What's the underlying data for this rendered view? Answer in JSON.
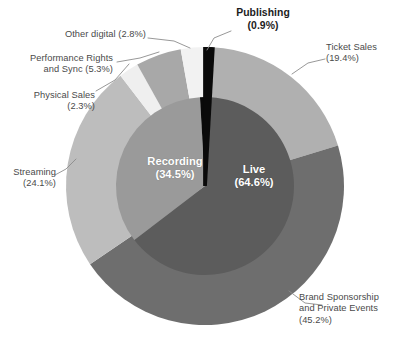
{
  "chart_data": {
    "type": "pie",
    "title": "",
    "subtitle": "",
    "xlabel": "",
    "ylabel": "",
    "legend_position": "none",
    "grid": false,
    "note": "Two-level donut: inner ring = top-level categories, outer ring = sub-categories",
    "rings": [
      {
        "name": "inner",
        "categories": [
          "Live",
          "Recording",
          "Publishing"
        ],
        "values": [
          64.6,
          34.5,
          0.9
        ],
        "colors": [
          "#5c5c5c",
          "#9a9a9a",
          "#0a0a0a"
        ],
        "labels_inside": [
          "Live\n(64.6%)",
          "Recording\n(34.5%)",
          ""
        ]
      },
      {
        "name": "outer",
        "categories": [
          "Publishing",
          "Ticket Sales",
          "Brand Sponsorship and Private Events",
          "Streaming",
          "Physical Sales",
          "Performance Rights and Sync",
          "Other digital"
        ],
        "values": [
          0.9,
          19.4,
          45.2,
          24.1,
          2.3,
          5.3,
          2.8
        ],
        "colors": [
          "#0a0a0a",
          "#b0b0b0",
          "#6e6e6e",
          "#bdbdbd",
          "#efefef",
          "#a8a8a8",
          "#f2f2f2"
        ]
      }
    ],
    "slices": [
      {
        "label": "Publishing",
        "value": 0.9,
        "display": "(0.9%)",
        "color": "#0a0a0a"
      },
      {
        "label": "Ticket Sales",
        "value": 19.4,
        "display": "(19.4%)",
        "color": "#b0b0b0"
      },
      {
        "label": "Brand Sponsorship and Private Events",
        "value": 45.2,
        "display": "(45.2%)",
        "color": "#6e6e6e"
      },
      {
        "label": "Streaming",
        "value": 24.1,
        "display": "(24.1%)",
        "color": "#bdbdbd"
      },
      {
        "label": "Physical Sales",
        "value": 2.3,
        "display": "(2.3%)",
        "color": "#efefef"
      },
      {
        "label": "Performance Rights and Sync",
        "value": 5.3,
        "display": "(5.3%)",
        "color": "#a8a8a8"
      },
      {
        "label": "Other digital",
        "value": 2.8,
        "display": "(2.8%)",
        "color": "#f2f2f2"
      },
      {
        "label": "Live",
        "value": 64.6,
        "display": "(64.6%)",
        "color": "#5c5c5c"
      },
      {
        "label": "Recording",
        "value": 34.5,
        "display": "(34.5%)",
        "color": "#9a9a9a"
      }
    ]
  },
  "labels": {
    "publishing": "Publishing\n(0.9%)",
    "ticket_sales": "Ticket Sales\n(19.4%)",
    "brand_sponsorship": "Brand Sponsorship\nand Private Events\n(45.2%)",
    "streaming": "Streaming\n(24.1%)",
    "physical_sales": "Physical Sales\n(2.3%)",
    "performance_rights": "Performance Rights\nand Sync (5.3%)",
    "other_digital": "Other digital (2.8%)",
    "live": "Live\n(64.6%)",
    "recording": "Recording\n(34.5%)"
  },
  "colors": {
    "publishing": "#0a0a0a",
    "ticket_sales": "#b0b0b0",
    "brand_sponsorship": "#6e6e6e",
    "streaming": "#bdbdbd",
    "physical_sales": "#efefef",
    "performance_rights": "#a8a8a8",
    "other_digital": "#f2f2f2",
    "live": "#5c5c5c",
    "recording": "#9a9a9a",
    "background": "#ffffff",
    "leader_line": "#8c8c8c",
    "text": "#4a4a4a",
    "text_bold": "#1c1c1c",
    "inner_text": "#ffffff"
  }
}
